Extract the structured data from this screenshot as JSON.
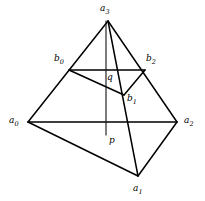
{
  "figure": {
    "width": 205,
    "height": 201,
    "background_color": "#ffffff",
    "line_color": "#000000"
  },
  "vertices": {
    "a3": {
      "label": "a",
      "sub": "3",
      "x": 108,
      "y": 21,
      "label_x": 100,
      "label_y": 4
    },
    "a0": {
      "label": "a",
      "sub": "0",
      "x": 28,
      "y": 122,
      "label_x": 9,
      "label_y": 116
    },
    "a1": {
      "label": "a",
      "sub": "1",
      "x": 138,
      "y": 176,
      "label_x": 133,
      "label_y": 184
    },
    "a2": {
      "label": "a",
      "sub": "2",
      "x": 177,
      "y": 122,
      "label_x": 184,
      "label_y": 116
    },
    "b0": {
      "label": "b",
      "sub": "0",
      "x": 69,
      "y": 70,
      "label_x": 54,
      "label_y": 54
    },
    "b1": {
      "label": "b",
      "sub": "1",
      "x": 124,
      "y": 95,
      "label_x": 127,
      "label_y": 94
    },
    "b2": {
      "label": "b",
      "sub": "2",
      "x": 145,
      "y": 70,
      "label_x": 146,
      "label_y": 54
    }
  },
  "points": {
    "p": {
      "label": "p",
      "x": 106,
      "y": 135,
      "label_x": 109,
      "label_y": 136
    },
    "q": {
      "label": "q",
      "x": 106,
      "y": 78,
      "label_x": 107,
      "label_y": 73
    }
  },
  "edges": [
    {
      "name": "a3-a0",
      "from": "a3",
      "to": "a0"
    },
    {
      "name": "a3-a2",
      "from": "a3",
      "to": "a2"
    },
    {
      "name": "a3-a1",
      "from": "a3",
      "to": "a1"
    },
    {
      "name": "a0-a2",
      "from": "a0",
      "to": "a2"
    },
    {
      "name": "a0-a1",
      "from": "a0",
      "to": "a1"
    },
    {
      "name": "a1-a2",
      "from": "a1",
      "to": "a2"
    },
    {
      "name": "b0-b2",
      "from": "b0",
      "to": "b2"
    },
    {
      "name": "b0-b1",
      "from": "b0",
      "to": "b1"
    },
    {
      "name": "b1-b2",
      "from": "b1",
      "to": "b2"
    }
  ],
  "vertical_segment": {
    "name": "a3-p-axis",
    "x": 106,
    "y1": 21,
    "y2": 135
  }
}
